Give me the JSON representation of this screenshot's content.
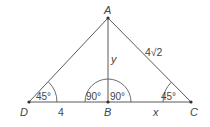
{
  "diagram": {
    "points": {
      "A": {
        "label": "A",
        "x": 108,
        "y": 18
      },
      "B": {
        "label": "B",
        "x": 108,
        "y": 102
      },
      "C": {
        "label": "C",
        "x": 191,
        "y": 102
      },
      "D": {
        "label": "D",
        "x": 29,
        "y": 102
      }
    },
    "segments": [
      {
        "from": "A",
        "to": "D"
      },
      {
        "from": "A",
        "to": "C"
      },
      {
        "from": "A",
        "to": "B"
      },
      {
        "from": "D",
        "to": "C"
      }
    ],
    "side_labels": {
      "DB": "4",
      "AB": "y",
      "AC": "4√2",
      "BC": "x"
    },
    "angle_labels": {
      "D": "45°",
      "ABD": "90°",
      "ABC": "90°",
      "C": "45°"
    },
    "colors": {
      "stroke": "#5a5a5a",
      "text": "#444444",
      "background": "#ffffff"
    }
  }
}
